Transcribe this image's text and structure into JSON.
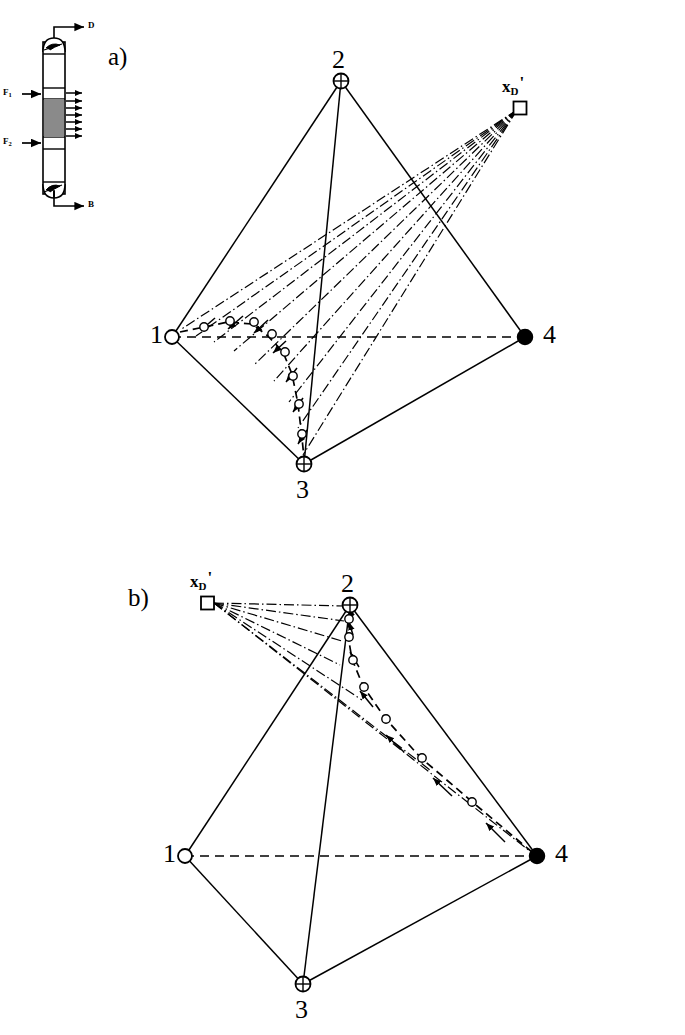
{
  "figure": {
    "panels": [
      {
        "id": "a",
        "label": "a)"
      },
      {
        "id": "b",
        "label": "b)"
      }
    ]
  },
  "column_schematic": {
    "name": "distillation-column",
    "streams": {
      "distillate": "D",
      "bottoms": "B",
      "feed_1": "F",
      "feed_1_sub": "1",
      "feed_2": "F",
      "feed_2_sub": "2"
    },
    "side_draw_count": 7,
    "packed_section_color": "#8a8a8a"
  },
  "panel_a": {
    "label": "a)",
    "vertices": [
      {
        "id": "1",
        "label": "1",
        "marker": "open-circle",
        "x": 172,
        "y": 337
      },
      {
        "id": "2",
        "label": "2",
        "marker": "crossed-circle",
        "x": 341,
        "y": 81
      },
      {
        "id": "3",
        "label": "3",
        "marker": "crossed-circle",
        "x": 304,
        "y": 464
      },
      {
        "id": "4",
        "label": "4",
        "marker": "filled-circle",
        "x": 525,
        "y": 337
      }
    ],
    "pole": {
      "label_main": "x",
      "label_sub": "D",
      "label_prime": "'",
      "marker": "open-square",
      "x": 520,
      "y": 107
    },
    "fan_line_count": 9,
    "profile_point_count": 9,
    "profile_from": "1",
    "profile_to": "3"
  },
  "panel_b": {
    "label": "b)",
    "vertices": [
      {
        "id": "1",
        "label": "1",
        "marker": "open-circle",
        "x": 185,
        "y": 856
      },
      {
        "id": "2",
        "label": "2",
        "marker": "crossed-circle",
        "x": 350,
        "y": 605
      },
      {
        "id": "3",
        "label": "3",
        "marker": "crossed-circle",
        "x": 303,
        "y": 984
      },
      {
        "id": "4",
        "label": "4",
        "marker": "filled-circle",
        "x": 537,
        "y": 856
      }
    ],
    "pole": {
      "label_main": "x",
      "label_sub": "D",
      "label_prime": "'",
      "marker": "open-square",
      "x": 207,
      "y": 598
    },
    "fan_line_count": 7,
    "profile_point_count": 8,
    "profile_from": "4",
    "profile_to": "2"
  },
  "colors": {
    "stroke": "#000000",
    "background": "#ffffff",
    "packing": "#8a8a8a"
  }
}
